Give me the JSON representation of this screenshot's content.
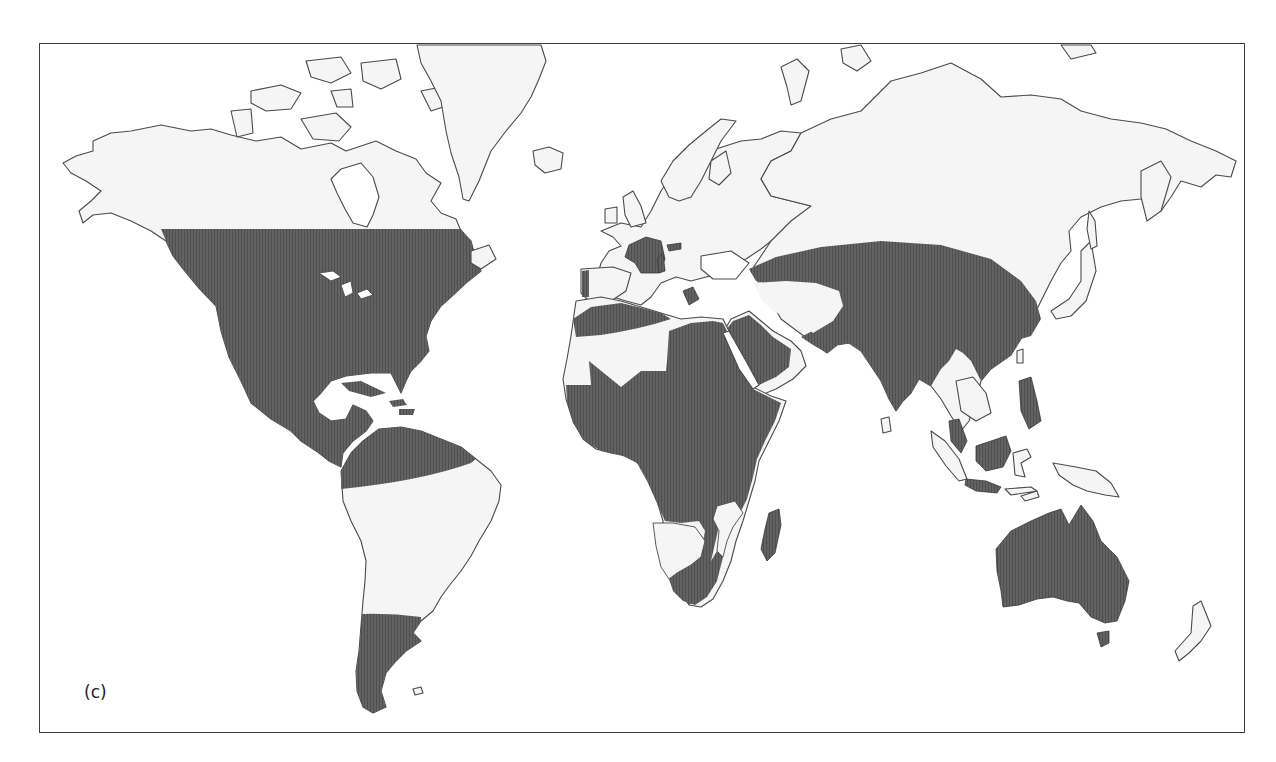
{
  "figure": {
    "panel_label": "(c)",
    "type": "world distribution map",
    "colors": {
      "background": "#ffffff",
      "land_unshaded": "#f5f5f5",
      "distribution_shaded": "#5a5a5a",
      "coastline": "#4a4a4a",
      "frame_border": "#3f3f3f"
    }
  },
  "legend": {
    "shaded_regions": [
      "United States, southern Canada",
      "Mexico and Central America",
      "Caribbean islands",
      "Northern South America (Colombia, Venezuela, Ecuador)",
      "Southern South America (Argentina, Chile)",
      "France and Iberian coast",
      "Northern Africa (Maghreb)",
      "Sub-Saharan Africa",
      "Madagascar",
      "Southern Africa",
      "Arabian Peninsula",
      "Turkey, Middle East, Central Asia",
      "India, Sri Lanka, South China",
      "Indochina (parts), Malay Peninsula",
      "Philippines",
      "Borneo, Java",
      "Australia, Tasmania"
    ]
  }
}
